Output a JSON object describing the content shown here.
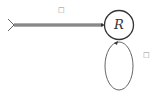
{
  "diagram": {
    "type": "state-machine",
    "states": [
      {
        "id": "R",
        "label": "R",
        "initial": true
      }
    ],
    "transitions": [
      {
        "from": "start",
        "to": "R",
        "label": "□"
      },
      {
        "from": "R",
        "to": "R",
        "label": "□"
      }
    ],
    "colors": {
      "stroke": "#333333",
      "label": "#888888"
    }
  }
}
